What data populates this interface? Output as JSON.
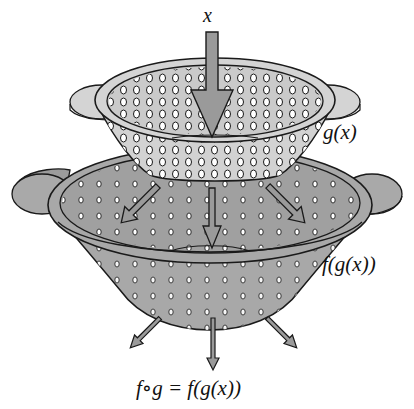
{
  "figure": {
    "labels": {
      "input": "x",
      "inner_function": "g(x)",
      "outer_function": "f(g(x))",
      "composition": "f∘g = f(g(x))"
    },
    "elements": {
      "top_colander": {
        "represents": "g",
        "fill": "#cfcfcf"
      },
      "bottom_colander": {
        "represents": "f",
        "fill": "#a9a9a9"
      },
      "input_arrow_count": 1,
      "middle_arrow_count": 3,
      "output_arrow_count": 3
    },
    "colors": {
      "outline": "#1a1a1a",
      "light_gray": "#d2d2d2",
      "mid_gray": "#a8a8a8",
      "arrow_fill": "#9a9a9a",
      "background": "#ffffff"
    }
  }
}
